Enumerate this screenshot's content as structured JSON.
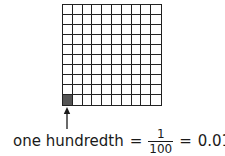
{
  "diagram": {
    "grid": {
      "rows": 10,
      "columns": 10,
      "shaded_cells": [
        {
          "row": 9,
          "col": 0
        }
      ],
      "shaded_color": "#555555",
      "line_color": "#222222"
    },
    "arrow": {
      "direction": "up",
      "points_to": "shaded cell"
    },
    "label": {
      "text": "one hundredth",
      "equals1": "=",
      "fraction_numerator": "1",
      "fraction_denominator": "100",
      "equals2": "=",
      "decimal": "0.01"
    }
  }
}
